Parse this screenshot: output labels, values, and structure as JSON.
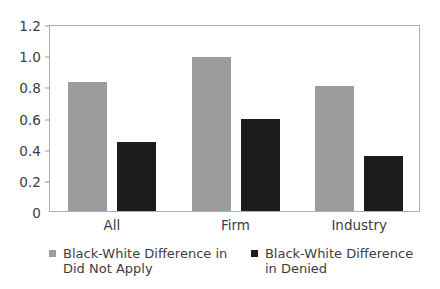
{
  "chart_data": {
    "type": "bar",
    "title": "",
    "subtitle": "",
    "xlabel": "",
    "ylabel": "",
    "categories": [
      "All",
      "Firm",
      "Industry"
    ],
    "series": [
      {
        "name": "Black-White Difference in Did Not Apply",
        "color": "#9c9c9c",
        "values": [
          0.83,
          0.99,
          0.8
        ]
      },
      {
        "name": "Black-White Difference in Denied",
        "color": "#1c1c1c",
        "values": [
          0.44,
          0.59,
          0.35
        ]
      }
    ],
    "ylim": [
      0,
      1.2
    ],
    "ytick_values": [
      1.2,
      1.0,
      0.8,
      0.6,
      0.4,
      0.2,
      0
    ],
    "ytick_labels": [
      "1.2",
      "1.0",
      "0.8",
      "0.6",
      "0.4",
      "0.2",
      "0"
    ],
    "grid": false,
    "legend_position": "bottom",
    "annotations": []
  },
  "legend": {
    "entries": [
      {
        "label": "Black-White Difference in Did Not Apply",
        "swatch": "series-0"
      },
      {
        "label": "Black-White Difference in Denied",
        "swatch": "series-1"
      }
    ]
  }
}
